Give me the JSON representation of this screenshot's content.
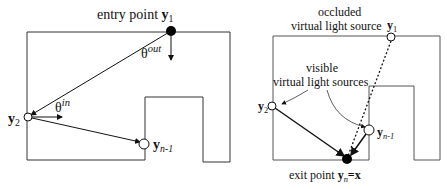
{
  "figure": {
    "left_panel": {
      "entry_label_text": "entry point",
      "entry_label_var": "y",
      "entry_label_sub": "1",
      "theta_symbol": "θ",
      "theta_out_sup": "out",
      "theta_in_sup": "in",
      "y2_var": "y",
      "y2_sub": "2",
      "yn1_var": "y",
      "yn1_sub": "n-1"
    },
    "right_panel": {
      "occluded_line1": "occluded",
      "occluded_line2": "virtual light source",
      "y1_var": "y",
      "y1_sub": "1",
      "visible_line1": "visible",
      "visible_line2": "virtual light sources",
      "y2_var": "y",
      "y2_sub": "2",
      "yn1_var": "y",
      "yn1_sub": "n-1",
      "exit_label_text": "exit point",
      "exit_var": "y",
      "exit_sub": "n",
      "exit_eq": "=x"
    }
  }
}
